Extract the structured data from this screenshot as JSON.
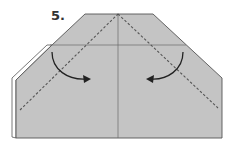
{
  "step": {
    "label": "5."
  },
  "colors": {
    "paper_front": "#c4c4c4",
    "paper_back": "#ffffff",
    "edge": "#555555",
    "crease": "#6a6a6a",
    "valley_fold": "#555555",
    "arrow": "#222222"
  },
  "diagram": {
    "folds": [
      {
        "type": "valley",
        "side": "left",
        "from": [
          20,
          110
        ],
        "to": [
          118,
          14
        ]
      },
      {
        "type": "valley",
        "side": "right",
        "from": [
          118,
          14
        ],
        "to": [
          218,
          108
        ]
      }
    ],
    "arrows": [
      {
        "side": "left",
        "direction": "fold-right"
      },
      {
        "side": "right",
        "direction": "fold-left"
      }
    ]
  }
}
